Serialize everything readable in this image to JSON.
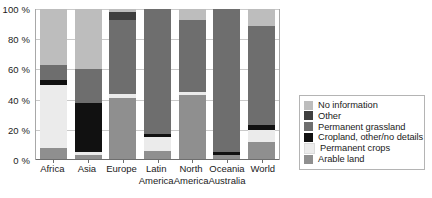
{
  "chart_data": {
    "type": "bar",
    "subtype": "stacked-100-percent",
    "title": "",
    "xlabel": "",
    "ylabel": "",
    "ylim": [
      0,
      100
    ],
    "yticks": [
      0,
      20,
      40,
      60,
      80,
      100
    ],
    "ytick_labels": [
      "0 %",
      "20 %",
      "40 %",
      "60 %",
      "80 %",
      "100 %"
    ],
    "grid": true,
    "legend_position": "right",
    "categories": [
      "Africa",
      "Asia",
      "Europe",
      "Latin America",
      "North America",
      "Oceania Australia",
      "World"
    ],
    "category_lines": [
      [
        "Africa"
      ],
      [
        "Asia"
      ],
      [
        "Europe"
      ],
      [
        "Latin",
        "America"
      ],
      [
        "North",
        "America"
      ],
      [
        "Oceania",
        "Australia"
      ],
      [
        "World"
      ]
    ],
    "series": [
      {
        "name": "Arable land",
        "color": "#8f8f8f",
        "values": [
          8,
          3,
          41,
          6,
          43,
          3,
          12
        ]
      },
      {
        "name": "Permanent crops",
        "color": "#ebebeb",
        "values": [
          42,
          2,
          3,
          9,
          2,
          0,
          8
        ]
      },
      {
        "name": "Cropland, other/no details",
        "color": "#111111",
        "values": [
          3,
          33,
          0,
          2,
          0,
          2,
          3
        ]
      },
      {
        "name": "Permanent grassland",
        "color": "#6e6e6e",
        "values": [
          10,
          22,
          49,
          83,
          48,
          95,
          66
        ]
      },
      {
        "name": "Other",
        "color": "#3f3f3f",
        "values": [
          0,
          0,
          5,
          0,
          0,
          0,
          0
        ]
      },
      {
        "name": "No information",
        "color": "#bdbdbd",
        "values": [
          37,
          40,
          2,
          0,
          7,
          0,
          11
        ]
      }
    ],
    "legend_entries": [
      {
        "label": "No information",
        "color": "#bdbdbd"
      },
      {
        "label": "Other",
        "color": "#3f3f3f"
      },
      {
        "label": "Permanent grassland",
        "color": "#6e6e6e"
      },
      {
        "label": "Cropland, other/no details",
        "color": "#111111"
      },
      {
        "label": "Permanent crops",
        "color": "#ebebeb"
      },
      {
        "label": "Arable land",
        "color": "#8f8f8f"
      }
    ],
    "stack_order_bottom_to_top": [
      "Arable land",
      "Permanent crops",
      "Cropland, other/no details",
      "Permanent grassland",
      "Other",
      "No information"
    ]
  }
}
